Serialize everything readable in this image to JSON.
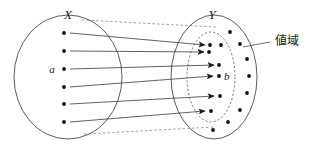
{
  "figure": {
    "type": "set-mapping-diagram",
    "background_color": "#ffffff",
    "stroke_color": "#3a3a3a",
    "dot_color": "#111111",
    "dash_color": "#7a7a7a"
  },
  "labels": {
    "domain_set": "X",
    "codomain_set": "Y",
    "element_a": "a",
    "element_b": "b",
    "range_callout": "値域"
  },
  "domain_set": {
    "name": "X",
    "label_pos": {
      "x": 68,
      "y": 19
    },
    "ellipse": {
      "cx": 68,
      "cy": 77,
      "rx": 54,
      "ry": 62
    },
    "elements": [
      {
        "id": "x1",
        "x": 64,
        "y": 33
      },
      {
        "id": "x2",
        "x": 64,
        "y": 51
      },
      {
        "id": "x3",
        "x": 64,
        "y": 69,
        "label": "a"
      },
      {
        "id": "x4",
        "x": 64,
        "y": 87
      },
      {
        "id": "x5",
        "x": 64,
        "y": 104
      },
      {
        "id": "x6",
        "x": 64,
        "y": 122
      }
    ]
  },
  "codomain_set": {
    "name": "Y",
    "label_pos": {
      "x": 212,
      "y": 19
    },
    "ellipse": {
      "cx": 214,
      "cy": 77,
      "rx": 43,
      "ry": 62
    },
    "outer_elements": [
      {
        "id": "y-o1",
        "x": 230,
        "y": 32
      },
      {
        "id": "y-o2",
        "x": 240,
        "y": 44
      },
      {
        "id": "y-o3",
        "x": 247,
        "y": 59
      },
      {
        "id": "y-o4",
        "x": 249,
        "y": 76
      },
      {
        "id": "y-o5",
        "x": 247,
        "y": 93
      },
      {
        "id": "y-o6",
        "x": 240,
        "y": 110
      },
      {
        "id": "y-o7",
        "x": 228,
        "y": 122
      },
      {
        "id": "y-o8",
        "x": 213,
        "y": 130
      }
    ]
  },
  "range_region": {
    "name": "値域",
    "style": "dashed",
    "ellipse": {
      "cx": 211,
      "cy": 77,
      "rx": 24,
      "ry": 45
    },
    "callout_label_pos": {
      "x": 275,
      "y": 45
    },
    "callout_line": {
      "x1": 243,
      "y1": 47,
      "x2": 270,
      "y2": 42
    },
    "elements": [
      {
        "id": "y1",
        "x": 210,
        "y": 45
      },
      {
        "id": "y2",
        "x": 221,
        "y": 45
      },
      {
        "id": "y3",
        "x": 209,
        "y": 52
      },
      {
        "id": "y4",
        "x": 219,
        "y": 65
      },
      {
        "id": "y5",
        "x": 219,
        "y": 76,
        "label": "b"
      },
      {
        "id": "y6",
        "x": 220,
        "y": 96
      },
      {
        "id": "y7",
        "x": 211,
        "y": 111
      }
    ]
  },
  "mappings": [
    {
      "from": "x1",
      "to": "y1",
      "x1": 70,
      "y1": 33,
      "x2": 205,
      "y2": 45
    },
    {
      "from": "x2",
      "to": "y3",
      "x1": 70,
      "y1": 51,
      "x2": 204,
      "y2": 52
    },
    {
      "from": "x3",
      "to": "y4",
      "x1": 70,
      "y1": 69,
      "x2": 214,
      "y2": 65
    },
    {
      "from": "x4",
      "to": "y5",
      "x1": 70,
      "y1": 87,
      "x2": 213,
      "y2": 76
    },
    {
      "from": "x5",
      "to": "y6",
      "x1": 70,
      "y1": 104,
      "x2": 214,
      "y2": 96
    },
    {
      "from": "x6",
      "to": "y7",
      "x1": 70,
      "y1": 122,
      "x2": 205,
      "y2": 111
    }
  ],
  "tangent_lines": [
    {
      "id": "top",
      "style": "dashed",
      "x1": 82,
      "y1": 20,
      "x2": 216,
      "y2": 27
    },
    {
      "id": "bottom",
      "style": "dashed",
      "x1": 84,
      "y1": 134,
      "x2": 214,
      "y2": 127
    }
  ]
}
